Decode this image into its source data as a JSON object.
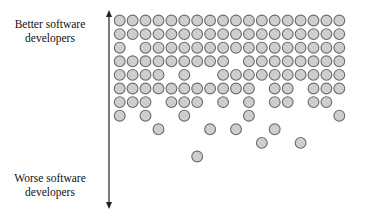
{
  "labels": {
    "top": "Better software developers",
    "bottom": "Worse software developers"
  },
  "axis": {
    "direction": "vertical-double-arrow",
    "top_meaning": "better",
    "bottom_meaning": "worse"
  },
  "colors": {
    "circle_fill": "#c9c9c9",
    "circle_stroke": "#6b6b6b",
    "hatch": "#e6e6e6",
    "axis": "#222222"
  },
  "grid": {
    "columns": 18,
    "rows": [
      {
        "row": 1,
        "cols": [
          1,
          2,
          3,
          4,
          5,
          6,
          7,
          8,
          9,
          10,
          11,
          12,
          13,
          14,
          15,
          16,
          17,
          18
        ]
      },
      {
        "row": 2,
        "cols": [
          1,
          2,
          3,
          4,
          5,
          6,
          7,
          8,
          9,
          10,
          11,
          12,
          13,
          14,
          15,
          16,
          17,
          18
        ]
      },
      {
        "row": 3,
        "cols": [
          1,
          3,
          4,
          5,
          6,
          7,
          8,
          9,
          10,
          11,
          12,
          13,
          14,
          15,
          16,
          17,
          18
        ]
      },
      {
        "row": 4,
        "cols": [
          1,
          2,
          3,
          4,
          5,
          6,
          7,
          8,
          9,
          11,
          12,
          13,
          14,
          15,
          16,
          17,
          18
        ]
      },
      {
        "row": 5,
        "cols": [
          1,
          2,
          3,
          4,
          6,
          9,
          10,
          11,
          12,
          13,
          14,
          15,
          16,
          17,
          18
        ]
      },
      {
        "row": 6,
        "cols": [
          1,
          2,
          3,
          4,
          5,
          6,
          7,
          8,
          9,
          10,
          11,
          13,
          14,
          16,
          17,
          18
        ]
      },
      {
        "row": 7,
        "cols": [
          1,
          2,
          3,
          5,
          6,
          7,
          9,
          11,
          13,
          14,
          16,
          17
        ]
      },
      {
        "row": 8,
        "cols": [
          1,
          3,
          6,
          11,
          18
        ]
      },
      {
        "row": 9,
        "cols": [
          4,
          8,
          10,
          13
        ]
      },
      {
        "row": 10,
        "cols": [
          12,
          15
        ]
      },
      {
        "row": 11,
        "cols": [
          7
        ]
      }
    ]
  }
}
